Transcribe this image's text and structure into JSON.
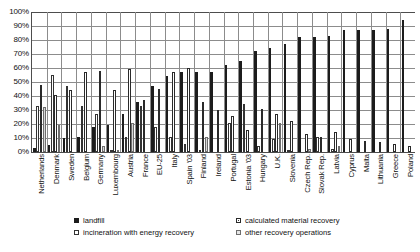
{
  "chart_data": {
    "type": "bar",
    "title": "",
    "subtitle": "",
    "xlabel": "",
    "ylabel": "",
    "ylim": [
      0,
      100
    ],
    "yticks": [
      "0%",
      "10%",
      "20%",
      "30%",
      "40%",
      "50%",
      "60%",
      "70%",
      "80%",
      "90%",
      "100%"
    ],
    "ytick_values": [
      0,
      10,
      20,
      30,
      40,
      50,
      60,
      70,
      80,
      90,
      100
    ],
    "grid": true,
    "legend_position": "bottom",
    "categories": [
      "Netherlands",
      "Denmark",
      "Sweden",
      "Belgium",
      "Germany",
      "Luxembourg",
      "Austria",
      "France",
      "EU-25",
      "Italy",
      "Spain '03",
      "Finland",
      "Ireland",
      "Portugal",
      "Estonia '03",
      "Hungary",
      "U.K.",
      "Slovenia",
      "Czech Rep.",
      "Slovak Rep.",
      "Latvia",
      "Cyprus",
      "Malta",
      "Lithuania",
      "Greece",
      "Poland"
    ],
    "series": [
      {
        "name": "landfill",
        "style": "solid-black",
        "color": "#1c1c1c",
        "values": [
          3,
          5,
          10,
          11,
          18,
          19,
          27,
          36,
          47,
          54,
          57,
          57,
          57,
          62,
          65,
          72,
          74,
          77,
          82,
          82,
          83,
          87,
          87,
          87,
          88,
          94
        ]
      },
      {
        "name": "incineration with energy recovery",
        "style": "white-outline",
        "color": "#ffffff",
        "values": [
          33,
          55,
          47,
          33,
          27,
          1,
          11,
          33,
          18,
          11,
          6,
          1,
          0,
          21,
          34,
          4,
          9,
          1,
          0,
          11,
          2,
          0,
          0,
          0,
          0,
          0
        ]
      },
      {
        "name": "calculated material recovery",
        "style": "checker-hatch",
        "color": "#3a3a3a",
        "values": [
          48,
          41,
          44,
          57,
          58,
          44,
          59,
          37,
          45,
          57,
          60,
          36,
          30,
          26,
          16,
          31,
          27,
          22,
          13,
          11,
          14,
          9,
          8,
          7,
          6,
          4
        ]
      },
      {
        "name": "other recovery operations",
        "style": "light-grey",
        "color": "#d9d9d9",
        "values": [
          32,
          19,
          0,
          0,
          4,
          1,
          21,
          0,
          0,
          0,
          0,
          11,
          0,
          0,
          0,
          0,
          21,
          0,
          2,
          0,
          4,
          0,
          0,
          0,
          0,
          0
        ]
      }
    ]
  },
  "legend": {
    "items": [
      {
        "label": "landfill",
        "swatch": "solid-black-swatch"
      },
      {
        "label": "calculated material recovery",
        "swatch": "checker-hatch-swatch"
      },
      {
        "label": "incineration with energy recovery",
        "swatch": "white-outline-swatch"
      },
      {
        "label": "other recovery operations",
        "swatch": "light-grey-swatch"
      }
    ]
  }
}
